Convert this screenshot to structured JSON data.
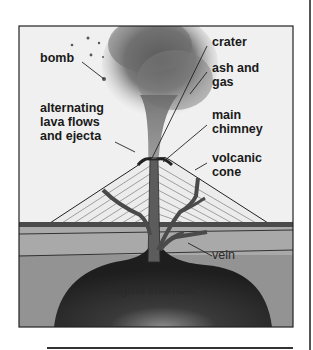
{
  "diagram": {
    "labels": {
      "bomb": "bomb",
      "alternating": [
        "alternating",
        "lava flows",
        "and ejecta"
      ],
      "crater": "crater",
      "ash_gas": [
        "ash and",
        "gas"
      ],
      "main_chimney": [
        "main",
        "chimney"
      ],
      "volcanic_cone": [
        "volcanic",
        "cone"
      ],
      "vein": "vein",
      "magma_chamber": "magma chamber"
    },
    "colors": {
      "sky": "#f2f2f2",
      "cone": "#ececec",
      "cone_lines": "#888888",
      "ash_cloud": "#6e6e6e",
      "surface_band": "#4a4a4a",
      "layer_upper": "#a8a8a8",
      "layer_lower": "#8e8e8e",
      "magma": "#262626",
      "chimney": "#5a5a5a",
      "frame": "#222222"
    }
  }
}
